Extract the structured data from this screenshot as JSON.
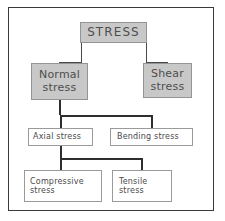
{
  "diagram": {
    "colors": {
      "frame_border": "#3a3a3a",
      "box_fill_gray": "#c8c8c8",
      "box_fill_white": "#ffffff",
      "box_border": "#8a8a8a",
      "connector": "#4a4a4a",
      "text": "#4a4a4a"
    },
    "nodes": {
      "stress": {
        "label": "STRESS",
        "fill": "gray",
        "level": 1
      },
      "normal": {
        "line1": "Normal",
        "line2": "stress",
        "fill": "gray",
        "level": 2
      },
      "shear": {
        "line1": "Shear",
        "line2": "stress",
        "fill": "gray",
        "level": 2
      },
      "axial": {
        "label": "Axial stress",
        "fill": "white",
        "level": 3
      },
      "bending": {
        "label": "Bending stress",
        "fill": "white",
        "level": 3
      },
      "compressive": {
        "line1": "Compressive",
        "line2": "stress",
        "fill": "white",
        "level": 4
      },
      "tensile": {
        "line1": "Tensile",
        "line2": "stress",
        "fill": "white",
        "level": 4
      }
    },
    "edges": [
      {
        "from": "stress",
        "to": "normal"
      },
      {
        "from": "stress",
        "to": "shear"
      },
      {
        "from": "normal",
        "to": "axial"
      },
      {
        "from": "normal",
        "to": "bending"
      },
      {
        "from": "axial",
        "to": "compressive"
      },
      {
        "from": "axial",
        "to": "tensile"
      }
    ]
  }
}
